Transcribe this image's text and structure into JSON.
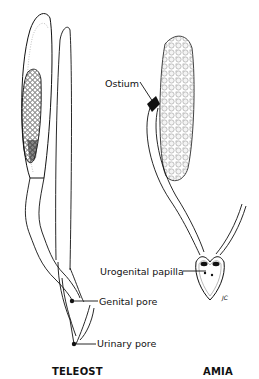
{
  "diagram": {
    "panels": [
      {
        "id": "teleost",
        "caption": "TELEOST",
        "labels": {
          "genital_pore": "Genital pore",
          "urinary_pore": "Urinary pore"
        }
      },
      {
        "id": "amia",
        "caption": "AMIA",
        "labels": {
          "ostium": "Ostium",
          "urogenital_papilla": "Urogenital papilla"
        },
        "signature": "JC"
      }
    ]
  }
}
